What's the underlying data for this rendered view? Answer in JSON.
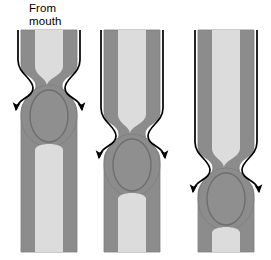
{
  "figure": {
    "title_text": "From\nmouth",
    "background_color": "#ffffff",
    "width": 271,
    "height": 260
  },
  "colors": {
    "wall": "#8c8c8c",
    "wall_edge": "#7d7d7d",
    "lumen": "#dcdcdc",
    "bolus_fill": "#8f8f8f",
    "bolus_outline": "#6e6e6e",
    "arrow": "#000000",
    "text": "#000000",
    "background": "#ffffff"
  },
  "geometry": {
    "tube_outer_half_width": 28,
    "tube_lumen_half_width": 14,
    "tube_top": 30,
    "tube_bottom": 252,
    "bulge_outer_half_width": 28,
    "panel_centers_x": [
      49,
      132,
      226
    ]
  },
  "panels": [
    {
      "id": "panel-1",
      "label": "stage-1-upper-esophagus",
      "center_x": 49,
      "constriction_y": 82,
      "bolus_center_y": 116,
      "bolus_rx": 19,
      "bolus_ry": 26,
      "arrow_top_y": 30,
      "arrow_tip_y": 114,
      "arrow_spread_x": 34
    },
    {
      "id": "panel-2",
      "label": "stage-2-mid-esophagus",
      "center_x": 132,
      "constriction_y": 130,
      "bolus_center_y": 165,
      "bolus_rx": 19,
      "bolus_ry": 26,
      "arrow_top_y": 30,
      "arrow_tip_y": 162,
      "arrow_spread_x": 34
    },
    {
      "id": "panel-3",
      "label": "stage-3-lower-esophagus",
      "center_x": 226,
      "constriction_y": 164,
      "bolus_center_y": 199,
      "bolus_rx": 19,
      "bolus_ry": 26,
      "arrow_top_y": 30,
      "arrow_tip_y": 196,
      "arrow_spread_x": 34
    }
  ],
  "arrows": {
    "count_per_panel": 2,
    "direction": "downward",
    "head_width": 9,
    "head_length": 11,
    "stroke_width": 1.7
  }
}
